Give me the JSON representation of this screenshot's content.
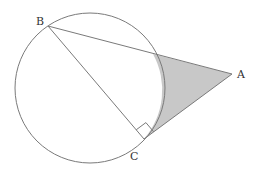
{
  "diagram": {
    "type": "geometry",
    "colors": {
      "stroke": "#7a7a7a",
      "shade": "#c8c8c8",
      "label": "#333333"
    },
    "circle": {
      "cx": 90,
      "cy": 88,
      "r": 75
    },
    "points": {
      "B": {
        "label": "B",
        "x": 48,
        "y": 26,
        "lx": 36,
        "ly": 25
      },
      "A": {
        "label": "A",
        "x": 232,
        "y": 74,
        "lx": 237,
        "ly": 78
      },
      "C": {
        "label": "C",
        "x": 144,
        "y": 139,
        "lx": 130,
        "ly": 160
      }
    },
    "segments": [
      "BA",
      "BC",
      "CA"
    ],
    "right_angle_at": "C",
    "shaded_region": "region bounded by segment from arc/BA intersection to A, segment A to C, and circle arc"
  }
}
